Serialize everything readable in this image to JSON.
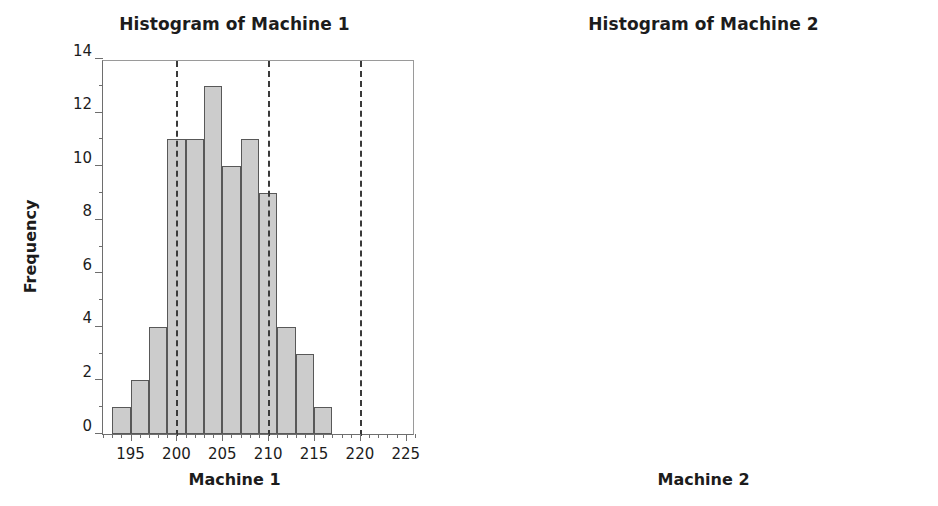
{
  "figure": {
    "width": 938,
    "height": 506,
    "background": "#ffffff",
    "bar_fill": "#cccccc",
    "bar_edge": "#585858",
    "spec_line_color": "#3a3a3a",
    "axis_color": "#6e6e6e",
    "text_color": "#1c1c1c"
  },
  "chart_data": [
    {
      "type": "bar",
      "subtype": "histogram",
      "title": "Histogram of Machine 1",
      "xlabel": "Machine 1",
      "ylabel": "Frequency",
      "xlim": [
        192,
        226
      ],
      "ylim": [
        0,
        14
      ],
      "grid": false,
      "legend": null,
      "xticks": [
        195,
        200,
        205,
        210,
        215,
        220,
        225
      ],
      "xtick_labels": [
        "195",
        "200",
        "205",
        "210",
        "215",
        "220",
        "225"
      ],
      "yticks": [
        0,
        2,
        4,
        6,
        8,
        10,
        12,
        14
      ],
      "ytick_labels": [
        "0",
        "2",
        "4",
        "6",
        "8",
        "10",
        "12",
        "14"
      ],
      "bin_width": 2,
      "bin_edges": [
        193,
        195,
        197,
        199,
        201,
        203,
        205,
        207,
        209,
        211,
        213,
        215,
        217
      ],
      "bin_centers": [
        194,
        196,
        198,
        200,
        202,
        204,
        206,
        208,
        210,
        212,
        214,
        216
      ],
      "categories": [
        "193-195",
        "195-197",
        "197-199",
        "199-201",
        "201-203",
        "203-205",
        "205-207",
        "207-209",
        "209-211",
        "211-213",
        "213-215",
        "215-217"
      ],
      "values": [
        1,
        2,
        4,
        11,
        11,
        13,
        10,
        11,
        9,
        4,
        3,
        1
      ],
      "annotations": [
        {
          "name": "lower-spec-limit",
          "type": "vline",
          "x": 200,
          "style": "dashed"
        },
        {
          "name": "target-line",
          "type": "vline",
          "x": 210,
          "style": "dashed"
        },
        {
          "name": "upper-spec-limit",
          "type": "vline",
          "x": 220,
          "style": "dashed"
        }
      ]
    },
    {
      "type": "bar",
      "subtype": "histogram",
      "title": "Histogram of Machine 2",
      "xlabel": "Machine 2",
      "ylabel": "",
      "xlim": [
        192,
        226
      ],
      "ylim": [
        0,
        21
      ],
      "grid": false,
      "legend": null,
      "xticks": [
        195,
        200,
        205,
        210,
        215,
        220,
        225
      ],
      "xtick_labels": [
        "195",
        "200",
        "205",
        "210",
        "215",
        "220",
        "225"
      ],
      "yticks": [
        0,
        5,
        10,
        15,
        20
      ],
      "ytick_labels": [
        "0",
        "5",
        "10",
        "15",
        "20"
      ],
      "bin_width": 2,
      "bin_edges": [
        201,
        203,
        205,
        207,
        209,
        211,
        213,
        215,
        217,
        221,
        223
      ],
      "bin_centers": [
        202,
        204,
        206,
        208,
        210,
        212,
        214,
        216,
        222
      ],
      "categories": [
        "201-203",
        "203-205",
        "205-207",
        "207-209",
        "209-211",
        "211-213",
        "213-215",
        "215-217",
        "221-223"
      ],
      "values": [
        1,
        4,
        8,
        11,
        19,
        20,
        10,
        6,
        1
      ],
      "annotations": [
        {
          "name": "lower-spec-limit",
          "type": "vline",
          "x": 200,
          "style": "dashed"
        },
        {
          "name": "target-line",
          "type": "vline",
          "x": 210,
          "style": "dashed"
        },
        {
          "name": "upper-spec-limit",
          "type": "vline",
          "x": 220,
          "style": "dashed"
        }
      ]
    }
  ]
}
